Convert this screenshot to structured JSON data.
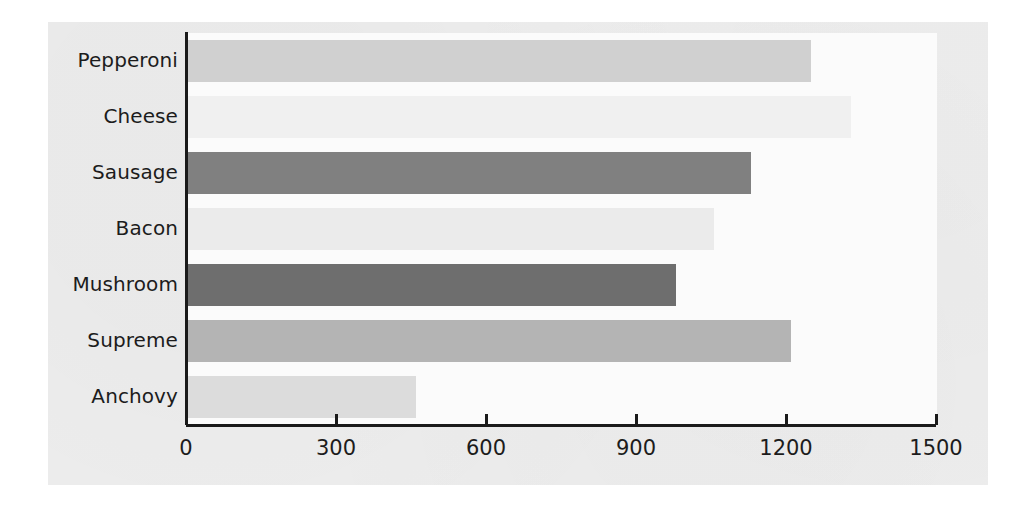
{
  "chart_data": {
    "type": "bar",
    "orientation": "horizontal",
    "title": "",
    "subtitle": "",
    "xlabel": "",
    "ylabel": "",
    "categories": [
      "Pepperoni",
      "Cheese",
      "Sausage",
      "Bacon",
      "Mushroom",
      "Supreme",
      "Anchovy"
    ],
    "values": [
      1250,
      1330,
      1130,
      1055,
      980,
      1210,
      460
    ],
    "bar_colors": [
      "#d0d0d0",
      "#f0f0f0",
      "#808080",
      "#ebebeb",
      "#6e6e6e",
      "#b4b4b4",
      "#dcdcdc"
    ],
    "xlim": [
      0,
      1500
    ],
    "x_ticks": [
      0,
      300,
      600,
      900,
      1200,
      1500
    ],
    "x_tick_labels": [
      "0",
      "300",
      "600",
      "900",
      "1200",
      "1500"
    ],
    "grid": false,
    "legend": "none",
    "axis_color": "#1a1a1a",
    "plot_background": "#fbfbfb",
    "figure_background": "#eeeeee"
  }
}
